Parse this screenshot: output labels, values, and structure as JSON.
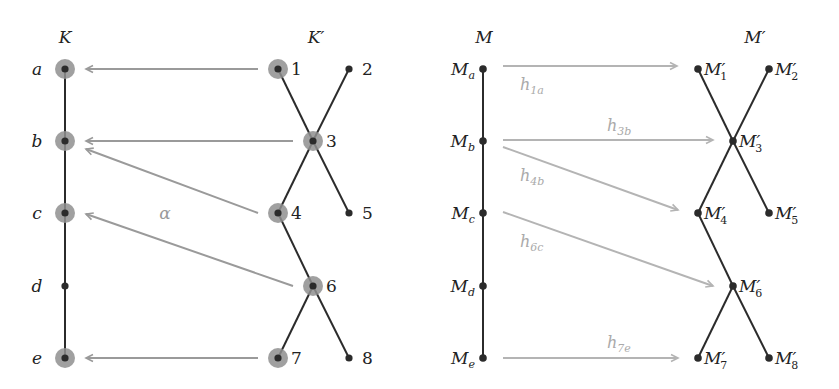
{
  "colors": {
    "edge": "#2b2b2b",
    "node": "#2b2b2b",
    "halo": "#8f8f8f",
    "arrow_left": "#9a9a9a",
    "arrow_right": "#b4b4b4",
    "text": "#222222",
    "text_faint": "#aaaaaa",
    "alpha": "#9a9a9a"
  },
  "left": {
    "title_K": "K",
    "title_Kprime": "K′",
    "chain_nodes": [
      {
        "id": "a",
        "label": "a",
        "x": 65,
        "y": 69,
        "halo": true
      },
      {
        "id": "b",
        "label": "b",
        "x": 65,
        "y": 141,
        "halo": true
      },
      {
        "id": "c",
        "label": "c",
        "x": 65,
        "y": 213,
        "halo": true
      },
      {
        "id": "d",
        "label": "d",
        "x": 65,
        "y": 286,
        "halo": false
      },
      {
        "id": "e",
        "label": "e",
        "x": 65,
        "y": 358,
        "halo": true
      }
    ],
    "tree_nodes": [
      {
        "id": "1",
        "label": "1",
        "x": 278,
        "y": 69,
        "halo": true
      },
      {
        "id": "2",
        "label": "2",
        "x": 349,
        "y": 69,
        "halo": false
      },
      {
        "id": "3",
        "label": "3",
        "x": 313,
        "y": 141,
        "halo": true
      },
      {
        "id": "4",
        "label": "4",
        "x": 278,
        "y": 213,
        "halo": true
      },
      {
        "id": "5",
        "label": "5",
        "x": 349,
        "y": 213,
        "halo": false
      },
      {
        "id": "6",
        "label": "6",
        "x": 313,
        "y": 286,
        "halo": true
      },
      {
        "id": "7",
        "label": "7",
        "x": 278,
        "y": 358,
        "halo": true
      },
      {
        "id": "8",
        "label": "8",
        "x": 349,
        "y": 358,
        "halo": false
      }
    ],
    "tree_edges": [
      [
        "1",
        "3"
      ],
      [
        "3",
        "5"
      ],
      [
        "2",
        "3"
      ],
      [
        "3",
        "4"
      ],
      [
        "4",
        "6"
      ],
      [
        "6",
        "8"
      ],
      [
        "6",
        "7"
      ]
    ],
    "arrows": [
      {
        "from": "1",
        "to": "a",
        "x1": 258,
        "y1": 69,
        "x2": 86,
        "y2": 69
      },
      {
        "from": "3",
        "to": "b",
        "x1": 293,
        "y1": 141,
        "x2": 86,
        "y2": 141
      },
      {
        "from": "4",
        "to": "b",
        "x1": 258,
        "y1": 213,
        "x2": 86,
        "y2": 149
      },
      {
        "from": "6",
        "to": "c",
        "x1": 293,
        "y1": 286,
        "x2": 86,
        "y2": 214
      },
      {
        "from": "7",
        "to": "e",
        "x1": 258,
        "y1": 358,
        "x2": 86,
        "y2": 358
      }
    ],
    "alpha_label": "α"
  },
  "right": {
    "title_M": "M",
    "title_Mprime": "M′",
    "chain_nodes": [
      {
        "id": "Ma",
        "base": "M",
        "sub": "a",
        "x": 483,
        "y": 69
      },
      {
        "id": "Mb",
        "base": "M",
        "sub": "b",
        "x": 483,
        "y": 141
      },
      {
        "id": "Mc",
        "base": "M",
        "sub": "c",
        "x": 483,
        "y": 213
      },
      {
        "id": "Md",
        "base": "M",
        "sub": "d",
        "x": 483,
        "y": 286
      },
      {
        "id": "Me",
        "base": "M",
        "sub": "e",
        "x": 483,
        "y": 358
      }
    ],
    "tree_nodes": [
      {
        "id": "M1",
        "base": "M′",
        "sub": "1",
        "x": 698,
        "y": 69
      },
      {
        "id": "M2",
        "base": "M′",
        "sub": "2",
        "x": 769,
        "y": 69
      },
      {
        "id": "M3",
        "base": "M′",
        "sub": "3",
        "x": 733,
        "y": 141
      },
      {
        "id": "M4",
        "base": "M′",
        "sub": "4",
        "x": 698,
        "y": 213
      },
      {
        "id": "M5",
        "base": "M′",
        "sub": "5",
        "x": 769,
        "y": 213
      },
      {
        "id": "M6",
        "base": "M′",
        "sub": "6",
        "x": 733,
        "y": 286
      },
      {
        "id": "M7",
        "base": "M′",
        "sub": "7",
        "x": 698,
        "y": 358
      },
      {
        "id": "M8",
        "base": "M′",
        "sub": "8",
        "x": 769,
        "y": 358
      }
    ],
    "tree_edges": [
      [
        "M1",
        "M3"
      ],
      [
        "M3",
        "M5"
      ],
      [
        "M2",
        "M3"
      ],
      [
        "M3",
        "M4"
      ],
      [
        "M4",
        "M6"
      ],
      [
        "M6",
        "M8"
      ],
      [
        "M6",
        "M7"
      ]
    ],
    "arrows": [
      {
        "from": "Ma",
        "to": "M1",
        "label": "h",
        "sub": "1a",
        "x1": 503,
        "y1": 66,
        "x2": 677,
        "y2": 66,
        "lx": 520,
        "ly": 90
      },
      {
        "from": "Mb",
        "to": "M3",
        "label": "h",
        "sub": "3b",
        "x1": 503,
        "y1": 140,
        "x2": 713,
        "y2": 140,
        "lx": 607,
        "ly": 131
      },
      {
        "from": "Mb",
        "to": "M4",
        "label": "h",
        "sub": "4b",
        "x1": 503,
        "y1": 147,
        "x2": 678,
        "y2": 210,
        "lx": 520,
        "ly": 181
      },
      {
        "from": "Mc",
        "to": "M6",
        "label": "h",
        "sub": "6c",
        "x1": 503,
        "y1": 212,
        "x2": 713,
        "y2": 286,
        "lx": 520,
        "ly": 247
      },
      {
        "from": "Me",
        "to": "M7",
        "label": "h",
        "sub": "7e",
        "x1": 503,
        "y1": 358,
        "x2": 678,
        "y2": 358,
        "lx": 607,
        "ly": 348
      }
    ]
  }
}
